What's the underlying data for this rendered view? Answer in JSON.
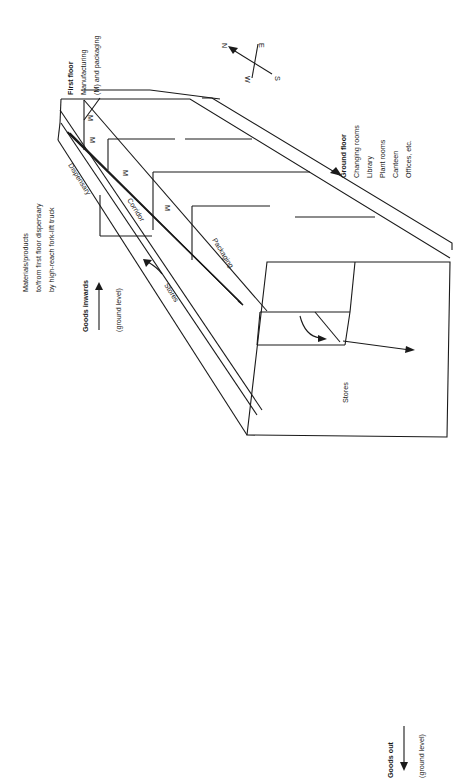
{
  "diagram": {
    "first_floor": {
      "heading": "First floor",
      "line1": "Manufacturing",
      "line2": "(M) and packaging"
    },
    "ground_floor": {
      "heading": "Ground floor",
      "items": [
        "Changing rooms",
        "Library",
        "Plant rooms",
        "Canteen",
        "Offices, etc."
      ]
    },
    "compass": {
      "n": "N",
      "e": "E",
      "s": "S",
      "w": "W"
    },
    "forklift_note": {
      "line1": "Materials/products",
      "line2": "to/from first floor dispensary",
      "line3": "by high-reach fork-lift truck"
    },
    "goods_inwards": {
      "heading": "Goods inwards",
      "sub": "(ground level)"
    },
    "goods_out": {
      "heading": "Goods out",
      "sub": "(ground level)"
    },
    "rooms": {
      "manufacturing": [
        "M",
        "M",
        "M",
        "M"
      ],
      "dispensary": "Dispensary",
      "corridor": "Corridor",
      "packaging": "Packaging",
      "stores_upper": "Stores",
      "stores_lower": "Stores"
    }
  }
}
